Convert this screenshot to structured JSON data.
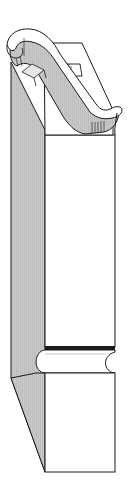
{
  "figure": {
    "alt": "Isometric line drawing of a stair newel post with a scrolled handrail cap, square shaft, and a molded collar above a square base",
    "colors": {
      "background": "#ffffff",
      "stroke": "#1a1a1a",
      "shade": "#c8c8c8",
      "shade_dark": "#a9a9a9",
      "face": "#ffffff"
    },
    "parts": [
      "handrail-scroll",
      "cap-block",
      "shaft",
      "collar",
      "base"
    ]
  }
}
